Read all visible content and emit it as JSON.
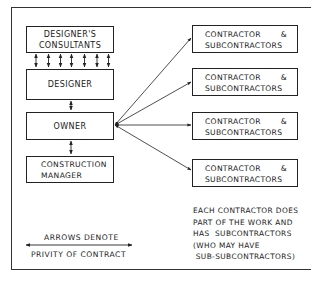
{
  "diagram": {
    "type": "organization / contract relationship diagram",
    "left_column": [
      {
        "id": "consultants",
        "lines": [
          "DESIGNER'S",
          "CONSULTANTS"
        ]
      },
      {
        "id": "designer",
        "lines": [
          "DESIGNER"
        ]
      },
      {
        "id": "owner",
        "lines": [
          "OWNER"
        ]
      },
      {
        "id": "construction_manager",
        "lines": [
          "CONSTRUCTION",
          "MANAGER"
        ]
      }
    ],
    "right_column": [
      {
        "id": "contractor_1",
        "line1_a": "CONTRACTOR",
        "line1_b": "&",
        "line2": "SUBCONTRACTORS"
      },
      {
        "id": "contractor_2",
        "line1_a": "CONTRACTOR",
        "line1_b": "&",
        "line2": "SUBCONTRACTORS"
      },
      {
        "id": "contractor_3",
        "line1_a": "CONTRACTOR",
        "line1_b": "&",
        "line2": "SUBCONTRACTORS"
      },
      {
        "id": "contractor_4",
        "line1_a": "CONTRACTOR",
        "line1_b": "&",
        "line2": "SUBCONTRACTORS"
      }
    ],
    "connections": [
      {
        "from": "consultants",
        "to": "designer",
        "style": "7 double-headed vertical arrows"
      },
      {
        "from": "designer",
        "to": "owner",
        "style": "double-headed arrow"
      },
      {
        "from": "owner",
        "to": "construction_manager",
        "style": "double-headed arrow"
      },
      {
        "from": "owner",
        "to": "contractor_1",
        "style": "double-headed arrow"
      },
      {
        "from": "owner",
        "to": "contractor_2",
        "style": "double-headed arrow"
      },
      {
        "from": "owner",
        "to": "contractor_3",
        "style": "double-headed arrow"
      },
      {
        "from": "owner",
        "to": "contractor_4",
        "style": "double-headed arrow"
      }
    ],
    "note": "EACH CONTRACTOR DOES\nPART OF THE WORK AND\nHAS  SUBCONTRACTORS\n(WHO MAY HAVE\n SUB-SUBCONTRACTORS)",
    "legend": {
      "line1": "ARROWS DENOTE",
      "line2": "PRIVITY OF CONTRACT"
    },
    "colors": {
      "line": "#222222",
      "background": "#ffffff"
    }
  }
}
